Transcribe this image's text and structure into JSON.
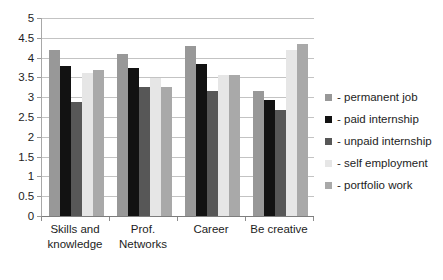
{
  "chart_data": {
    "type": "bar",
    "title": "",
    "xlabel": "",
    "ylabel": "",
    "ylim": [
      0,
      5
    ],
    "ytick_step": 0.5,
    "grid": true,
    "legend_position": "right",
    "categories": [
      "Skills and knowledge",
      "Prof. Networks",
      "Career",
      "Be creative"
    ],
    "ytick_labels": [
      "5",
      "4.5",
      "4",
      "3.5",
      "3",
      "2.5",
      "2",
      "1.5",
      "1",
      "0.5",
      "0"
    ],
    "ytick_values": [
      5,
      4.5,
      4,
      3.5,
      3,
      2.5,
      2,
      1.5,
      1,
      0.5,
      0
    ],
    "series": [
      {
        "name": "- permanent job",
        "color": "#989898",
        "values": [
          4.2,
          4.1,
          4.3,
          3.15
        ]
      },
      {
        "name": "- paid internship",
        "color": "#121212",
        "values": [
          3.78,
          3.75,
          3.85,
          2.92
        ]
      },
      {
        "name": "- unpaid internship",
        "color": "#575757",
        "values": [
          2.88,
          3.25,
          3.15,
          2.68
        ]
      },
      {
        "name": "- self employment",
        "color": "#e6e6e6",
        "values": [
          3.6,
          3.48,
          3.57,
          4.2
        ]
      },
      {
        "name": "- portfolio work",
        "color": "#a9a9a9",
        "values": [
          3.68,
          3.25,
          3.55,
          4.35
        ]
      }
    ]
  },
  "legend": {
    "items": [
      {
        "label": "- permanent job",
        "color": "#989898"
      },
      {
        "label": "- paid internship",
        "color": "#121212"
      },
      {
        "label": "- unpaid internship",
        "color": "#575757"
      },
      {
        "label": "- self employment",
        "color": "#e6e6e6"
      },
      {
        "label": "- portfolio work",
        "color": "#a9a9a9"
      }
    ]
  },
  "axes": {
    "y": {
      "labels": [
        "5",
        "4.5",
        "4",
        "3.5",
        "3",
        "2.5",
        "2",
        "1.5",
        "1",
        "0.5",
        "0"
      ]
    },
    "x": {
      "labels": [
        "Skills and knowledge",
        "Prof. Networks",
        "Career",
        "Be creative"
      ]
    }
  }
}
